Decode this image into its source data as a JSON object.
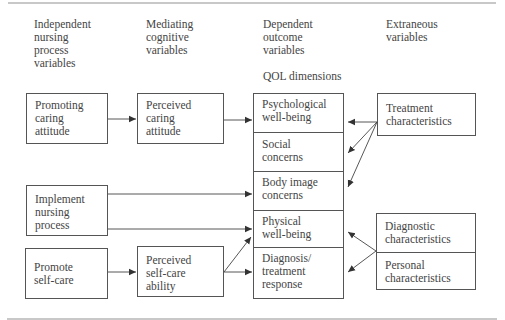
{
  "headers": {
    "independent": "Independent\nnursing\nprocess\nvariables",
    "mediating": "Mediating\ncognitive\nvariables",
    "dependent": "Dependent\noutcome\nvariables",
    "extraneous": "Extraneous\nvariables",
    "qol": "QOL dimensions"
  },
  "independent_boxes": [
    {
      "label": "Promoting\ncaring\nattitude"
    },
    {
      "label": "Implement\nnursing\nprocess"
    },
    {
      "label": "Promote\nself-care"
    }
  ],
  "mediating_boxes": [
    {
      "label": "Perceived\ncaring\nattitude"
    },
    {
      "label": "Perceived\nself-care\nability"
    }
  ],
  "qol_dimensions": [
    {
      "label": "Psychological\nwell-being"
    },
    {
      "label": "Social\nconcerns"
    },
    {
      "label": "Body image\nconcerns"
    },
    {
      "label": "Physical\nwell-being"
    },
    {
      "label": "Diagnosis/\ntreatment\nresponse"
    }
  ],
  "extraneous_boxes": {
    "treatment": "Treatment\ncharacteristics",
    "diagnostic": "Diagnostic\ncharacteristics",
    "personal": "Personal\ncharacteristics"
  },
  "colors": {
    "line": "#555555",
    "text": "#444444",
    "rule": "#c8c8c8"
  }
}
